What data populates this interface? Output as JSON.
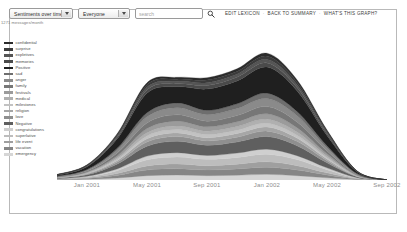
{
  "toolbar": {
    "view_select": {
      "value": "Sentiments over time",
      "options": [
        "Sentiments over time",
        "Messages over time",
        "People over time"
      ]
    },
    "people_select": {
      "value": "Everyone",
      "options": [
        "Everyone"
      ]
    },
    "search": {
      "value": "",
      "placeholder": "search"
    },
    "search_icon": "search-icon",
    "links": [
      {
        "label": "EDIT LEXICON"
      },
      {
        "label": "BACK TO SUMMARY"
      },
      {
        "label": "WHAT'S THIS GRAPH?"
      }
    ],
    "separator": "·"
  },
  "caption": "1271 messages/month",
  "legend": {
    "items": [
      {
        "label": "confidential",
        "color": "#2b2b2b"
      },
      {
        "label": "surprise",
        "color": "#3b3b3b"
      },
      {
        "label": "expletives",
        "color": "#555555"
      },
      {
        "label": "memories",
        "color": "#4a4a4a"
      },
      {
        "label": "Positive",
        "color": "#1f1f1f"
      },
      {
        "label": "sad",
        "color": "#6e6e6e"
      },
      {
        "label": "anger",
        "color": "#8a8a8a"
      },
      {
        "label": "family",
        "color": "#777777"
      },
      {
        "label": "festivals",
        "color": "#9b9b9b"
      },
      {
        "label": "medical",
        "color": "#b0b0b0"
      },
      {
        "label": "milestones",
        "color": "#c2c2c2"
      },
      {
        "label": "religion",
        "color": "#a6a6a6"
      },
      {
        "label": "love",
        "color": "#8f8f8f"
      },
      {
        "label": "Negative",
        "color": "#5f5f5f"
      },
      {
        "label": "congratulations",
        "color": "#cfcfcf"
      },
      {
        "label": "superlative",
        "color": "#bdbdbd"
      },
      {
        "label": "life event",
        "color": "#9f9f9f"
      },
      {
        "label": "vacation",
        "color": "#868686"
      },
      {
        "label": "emergency",
        "color": "#d6d6d6"
      }
    ]
  },
  "chart_data": {
    "type": "area",
    "title": "",
    "xlabel": "",
    "ylabel": "",
    "stacked": true,
    "grid": false,
    "legend_position": "left",
    "x": [
      "Nov 2000",
      "Jan 2001",
      "Mar 2001",
      "May 2001",
      "Jul 2001",
      "Sep 2001",
      "Nov 2001",
      "Jan 2002",
      "Mar 2002",
      "May 2002",
      "Jul 2002",
      "Sep 2002"
    ],
    "xticks": [
      "Jan 2001",
      "May 2001",
      "Sep 2001",
      "Jan 2002",
      "May 2002",
      "Sep 2002"
    ],
    "xlim": [
      "Nov 2000",
      "Oct 2002"
    ],
    "ylim": [
      0,
      1400
    ],
    "series": [
      {
        "name": "emergency",
        "color": "#d6d6d6",
        "values": [
          2,
          6,
          18,
          40,
          46,
          40,
          44,
          52,
          40,
          20,
          4,
          0
        ]
      },
      {
        "name": "vacation",
        "color": "#868686",
        "values": [
          3,
          8,
          24,
          52,
          58,
          52,
          58,
          66,
          52,
          26,
          5,
          0
        ]
      },
      {
        "name": "life event",
        "color": "#9f9f9f",
        "values": [
          2,
          6,
          18,
          38,
          44,
          40,
          44,
          50,
          40,
          20,
          4,
          0
        ]
      },
      {
        "name": "superlative",
        "color": "#bdbdbd",
        "values": [
          3,
          9,
          26,
          56,
          64,
          58,
          62,
          70,
          56,
          28,
          5,
          0
        ]
      },
      {
        "name": "congratulations",
        "color": "#cfcfcf",
        "values": [
          2,
          5,
          16,
          34,
          40,
          36,
          40,
          46,
          36,
          18,
          3,
          0
        ]
      },
      {
        "name": "Negative",
        "color": "#5f5f5f",
        "values": [
          5,
          14,
          44,
          92,
          104,
          94,
          102,
          116,
          92,
          46,
          8,
          0
        ]
      },
      {
        "name": "love",
        "color": "#8f8f8f",
        "values": [
          2,
          6,
          18,
          38,
          44,
          40,
          44,
          50,
          40,
          20,
          4,
          0
        ]
      },
      {
        "name": "religion",
        "color": "#a6a6a6",
        "values": [
          2,
          5,
          14,
          30,
          34,
          30,
          34,
          38,
          30,
          15,
          3,
          0
        ]
      },
      {
        "name": "milestones",
        "color": "#c2c2c2",
        "values": [
          2,
          4,
          12,
          26,
          30,
          28,
          30,
          34,
          26,
          13,
          2,
          0
        ]
      },
      {
        "name": "medical",
        "color": "#b0b0b0",
        "values": [
          2,
          5,
          14,
          30,
          34,
          32,
          34,
          38,
          30,
          15,
          3,
          0
        ]
      },
      {
        "name": "festivals",
        "color": "#9b9b9b",
        "values": [
          2,
          6,
          18,
          38,
          44,
          40,
          44,
          50,
          40,
          20,
          4,
          0
        ]
      },
      {
        "name": "family",
        "color": "#777777",
        "values": [
          3,
          8,
          24,
          50,
          58,
          52,
          58,
          66,
          52,
          26,
          5,
          0
        ]
      },
      {
        "name": "anger",
        "color": "#8a8a8a",
        "values": [
          3,
          9,
          28,
          58,
          66,
          60,
          64,
          74,
          58,
          29,
          5,
          0
        ]
      },
      {
        "name": "sad",
        "color": "#6e6e6e",
        "values": [
          2,
          6,
          18,
          38,
          44,
          40,
          44,
          50,
          40,
          20,
          4,
          0
        ]
      },
      {
        "name": "Positive",
        "color": "#1f1f1f",
        "values": [
          8,
          26,
          86,
          180,
          150,
          196,
          210,
          240,
          190,
          94,
          16,
          0
        ]
      },
      {
        "name": "memories",
        "color": "#4a4a4a",
        "values": [
          2,
          5,
          14,
          30,
          26,
          32,
          34,
          38,
          30,
          15,
          3,
          0
        ]
      },
      {
        "name": "expletives",
        "color": "#555555",
        "values": [
          2,
          4,
          12,
          24,
          22,
          26,
          28,
          32,
          25,
          12,
          2,
          0
        ]
      },
      {
        "name": "surprise",
        "color": "#3b3b3b",
        "values": [
          2,
          4,
          10,
          22,
          20,
          24,
          26,
          30,
          24,
          12,
          2,
          0
        ]
      },
      {
        "name": "confidential",
        "color": "#2b2b2b",
        "values": [
          2,
          4,
          10,
          20,
          18,
          22,
          24,
          28,
          22,
          11,
          2,
          0
        ]
      }
    ]
  }
}
